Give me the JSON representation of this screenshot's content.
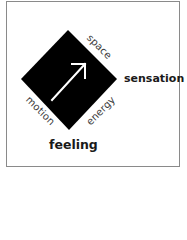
{
  "diagram": {
    "edges": {
      "top_right": "space",
      "bottom_right": "energy",
      "bottom_left": "motion"
    },
    "poles": {
      "right": "sensation",
      "bottom": "feeling"
    },
    "shape": "diamond",
    "arrow_direction": "up-right",
    "colors": {
      "diamond": "#000000",
      "arrow": "#ffffff",
      "frame": "#8a8a8a",
      "background": "#ffffff",
      "text": "#1a1a1a"
    }
  }
}
